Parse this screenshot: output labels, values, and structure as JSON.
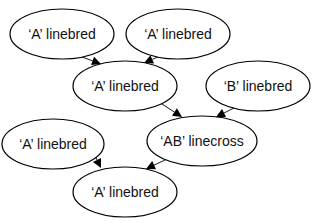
{
  "diagram": {
    "type": "directed-graph",
    "nodes": [
      {
        "id": "n1",
        "label": "‘A’ linebred",
        "cx": 62,
        "cy": 34,
        "rx": 52,
        "ry": 25
      },
      {
        "id": "n2",
        "label": "‘A’ linebred",
        "cx": 178,
        "cy": 34,
        "rx": 52,
        "ry": 25
      },
      {
        "id": "n3",
        "label": "‘A’ linebred",
        "cx": 125,
        "cy": 86,
        "rx": 52,
        "ry": 25
      },
      {
        "id": "n4",
        "label": "‘B’ linebred",
        "cx": 258,
        "cy": 86,
        "rx": 52,
        "ry": 25
      },
      {
        "id": "n5",
        "label": "‘A’ linebred",
        "cx": 53,
        "cy": 144,
        "rx": 51,
        "ry": 25
      },
      {
        "id": "n6",
        "label": "‘AB’ linecross",
        "cx": 202,
        "cy": 141,
        "rx": 55,
        "ry": 25
      },
      {
        "id": "n7",
        "label": "‘A’ linebred",
        "cx": 125,
        "cy": 192,
        "rx": 52,
        "ry": 25
      }
    ],
    "edges": [
      {
        "from": "n1",
        "to": "n3",
        "x1": 82,
        "y1": 57,
        "x2": 101,
        "y2": 64
      },
      {
        "from": "n2",
        "to": "n3",
        "x1": 160,
        "y1": 56,
        "x2": 144,
        "y2": 63
      },
      {
        "from": "n3",
        "to": "n6",
        "x1": 162,
        "y1": 104,
        "x2": 182,
        "y2": 117
      },
      {
        "from": "n4",
        "to": "n6",
        "x1": 236,
        "y1": 107,
        "x2": 216,
        "y2": 117
      },
      {
        "from": "n5",
        "to": "n7",
        "x1": 94,
        "y1": 154,
        "x2": 101,
        "y2": 168
      },
      {
        "from": "n6",
        "to": "n7",
        "x1": 165,
        "y1": 160,
        "x2": 146,
        "y2": 169
      }
    ]
  }
}
